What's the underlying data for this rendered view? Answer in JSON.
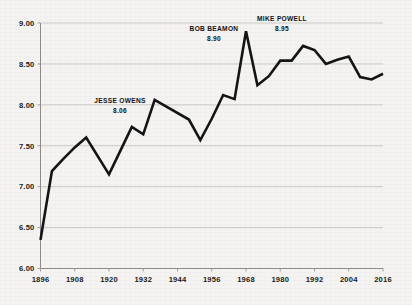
{
  "chart_data": {
    "type": "line",
    "title": "",
    "subtitle": "",
    "xlabel": "",
    "ylabel": "",
    "xlim": [
      1896,
      2016
    ],
    "ylim": [
      6.0,
      9.0
    ],
    "grid": true,
    "legend_position": "none",
    "y_ticks": [
      "9.00",
      "8.50",
      "8.00",
      "7.50",
      "7.00",
      "6.50",
      "6.00"
    ],
    "y_tick_values": [
      9.0,
      8.5,
      8.0,
      7.5,
      7.0,
      6.5,
      6.0
    ],
    "x_ticks": [
      "1896",
      "1908",
      "1920",
      "1932",
      "1944",
      "1956",
      "1968",
      "1980",
      "1992",
      "2004",
      "2016"
    ],
    "x_tick_values": [
      1896,
      1908,
      1920,
      1932,
      1944,
      1956,
      1968,
      1980,
      1992,
      2004,
      2016
    ],
    "series": [
      {
        "name": "Olympic long jump gold medal distance (m)",
        "x": [
          1896,
          1900,
          1904,
          1908,
          1912,
          1920,
          1924,
          1928,
          1932,
          1936,
          1948,
          1952,
          1956,
          1960,
          1964,
          1968,
          1972,
          1976,
          1980,
          1984,
          1988,
          1992,
          1996,
          2000,
          2004,
          2008,
          2012,
          2016
        ],
        "values": [
          6.35,
          7.19,
          7.34,
          7.48,
          7.6,
          7.15,
          7.44,
          7.73,
          7.64,
          8.06,
          7.82,
          7.57,
          7.83,
          8.12,
          8.07,
          8.9,
          8.24,
          8.35,
          8.54,
          8.54,
          8.72,
          8.67,
          8.5,
          8.55,
          8.59,
          8.34,
          8.31,
          8.38
        ]
      }
    ],
    "annotations": [
      {
        "name": "JESSE OWENS",
        "value": "8.06",
        "year": 1936,
        "y": 8.06
      },
      {
        "name": "BOB BEAMON",
        "value": "8.90",
        "year": 1968,
        "y": 8.9
      },
      {
        "name": "MIKE POWELL",
        "value": "8.95",
        "year": 1991,
        "y": 8.95
      }
    ],
    "colors": {
      "line": "#141414",
      "grid": "#b9b7b2",
      "axis": "#8d8b86",
      "background": "#f4f3f1",
      "text": "#1b1b1b"
    }
  }
}
